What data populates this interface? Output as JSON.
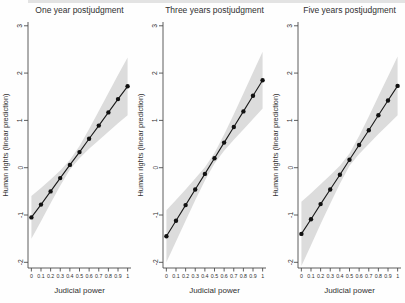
{
  "figure": {
    "background": "#fefefe",
    "panel_count": 3
  },
  "chart_data": [
    {
      "type": "line",
      "title": "One year postjudgment",
      "xlabel": "Judicial power",
      "ylabel": "Human rights (linear prediction)",
      "x": [
        0,
        0.1,
        0.2,
        0.3,
        0.4,
        0.5,
        0.6,
        0.7,
        0.8,
        0.9,
        1
      ],
      "x_tick_labels": [
        "0",
        "0.1",
        "0.2",
        "0.3",
        "0.4",
        "0.5",
        "0.6",
        "0.7",
        "0.8",
        "0.9",
        "1"
      ],
      "y_ticks": [
        -2,
        -1,
        0,
        1,
        2,
        3
      ],
      "xlim": [
        -0.035,
        1.035
      ],
      "ylim": [
        -2.12,
        3.08
      ],
      "grid": false,
      "legend": "none",
      "series": [
        {
          "name": "Linear prediction",
          "values": [
            -1.05,
            -0.78,
            -0.5,
            -0.22,
            0.06,
            0.33,
            0.61,
            0.89,
            1.17,
            1.45,
            1.72
          ]
        }
      ],
      "ci_lower": [
        -1.5,
        -1.13,
        -0.75,
        -0.38,
        -0.04,
        0.2,
        0.4,
        0.58,
        0.76,
        0.94,
        1.11
      ],
      "ci_upper": [
        -0.6,
        -0.43,
        -0.25,
        -0.06,
        0.16,
        0.46,
        0.82,
        1.2,
        1.58,
        1.96,
        2.33
      ],
      "colors": {
        "line": "#1a1a1a",
        "marker": "#111111",
        "band": "#dcdcdc",
        "text": "#303030",
        "axis": "#4d4d4d"
      }
    },
    {
      "type": "line",
      "title": "Three years postjudgment",
      "xlabel": "Judicial power",
      "ylabel": "Human rights (linear prediction)",
      "x": [
        0,
        0.1,
        0.2,
        0.3,
        0.4,
        0.5,
        0.6,
        0.7,
        0.8,
        0.9,
        1
      ],
      "x_tick_labels": [
        "0",
        "0.1",
        "0.2",
        "0.3",
        "0.4",
        "0.5",
        "0.6",
        "0.7",
        "0.8",
        "0.9",
        "1"
      ],
      "y_ticks": [
        -2,
        -1,
        0,
        1,
        2,
        3
      ],
      "xlim": [
        -0.035,
        1.035
      ],
      "ylim": [
        -2.12,
        3.08
      ],
      "grid": false,
      "legend": "none",
      "series": [
        {
          "name": "Linear prediction",
          "values": [
            -1.45,
            -1.12,
            -0.79,
            -0.46,
            -0.13,
            0.2,
            0.53,
            0.86,
            1.19,
            1.52,
            1.85
          ]
        }
      ],
      "ci_lower": [
        -2.0,
        -1.56,
        -1.12,
        -0.69,
        -0.27,
        0.09,
        0.36,
        0.59,
        0.81,
        1.03,
        1.25
      ],
      "ci_upper": [
        -0.9,
        -0.68,
        -0.46,
        -0.23,
        0.01,
        0.31,
        0.7,
        1.13,
        1.57,
        2.01,
        2.45
      ],
      "colors": {
        "line": "#1a1a1a",
        "marker": "#111111",
        "band": "#dcdcdc",
        "text": "#303030",
        "axis": "#4d4d4d"
      }
    },
    {
      "type": "line",
      "title": "Five years postjudgment",
      "xlabel": "Judicial power",
      "ylabel": "Human rights (linear prediction)",
      "x": [
        0,
        0.1,
        0.2,
        0.3,
        0.4,
        0.5,
        0.6,
        0.7,
        0.8,
        0.9,
        1
      ],
      "x_tick_labels": [
        "0",
        "0.1",
        "0.2",
        "0.3",
        "0.4",
        "0.5",
        "0.6",
        "0.7",
        "0.8",
        "0.9",
        "1"
      ],
      "y_ticks": [
        -2,
        -1,
        0,
        1,
        2,
        3
      ],
      "xlim": [
        -0.035,
        1.035
      ],
      "ylim": [
        -2.12,
        3.08
      ],
      "grid": false,
      "legend": "none",
      "series": [
        {
          "name": "Linear prediction",
          "values": [
            -1.4,
            -1.09,
            -0.77,
            -0.46,
            -0.15,
            0.17,
            0.48,
            0.79,
            1.11,
            1.42,
            1.73
          ]
        }
      ],
      "ci_lower": [
        -2.08,
        -1.64,
        -1.19,
        -0.76,
        -0.34,
        0.04,
        0.29,
        0.5,
        0.71,
        0.91,
        1.11
      ],
      "ci_upper": [
        -0.72,
        -0.54,
        -0.35,
        -0.16,
        0.04,
        0.3,
        0.67,
        1.08,
        1.51,
        1.93,
        2.35
      ],
      "colors": {
        "line": "#1a1a1a",
        "marker": "#111111",
        "band": "#dcdcdc",
        "text": "#303030",
        "axis": "#4d4d4d"
      }
    }
  ]
}
